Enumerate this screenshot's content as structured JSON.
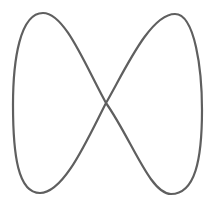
{
  "figure": {
    "stroke_color": "#5f5f5f",
    "stroke_width": 2.2,
    "background": "#ffffff",
    "path": "M 106 103 C 132 140, 150 194, 171 194 C 195 194, 202 160, 202 110 C 202 70, 195 14, 175 14 C 150 14, 125 70, 106 103 C 87 140, 64 193, 40 193 C 18 193, 13 155, 13 105 C 13 60, 20 13, 43 13 C 65 13, 85 65, 106 103 Z",
    "points_of_interest": {
      "crossing": [
        106,
        103
      ],
      "top_left_peak": [
        43,
        13
      ],
      "top_right_peak": [
        175,
        14
      ],
      "bottom_left_trough": [
        40,
        193
      ],
      "bottom_right_trough": [
        171,
        194
      ],
      "left_extreme": [
        13,
        105
      ],
      "right_extreme": [
        202,
        110
      ]
    }
  }
}
